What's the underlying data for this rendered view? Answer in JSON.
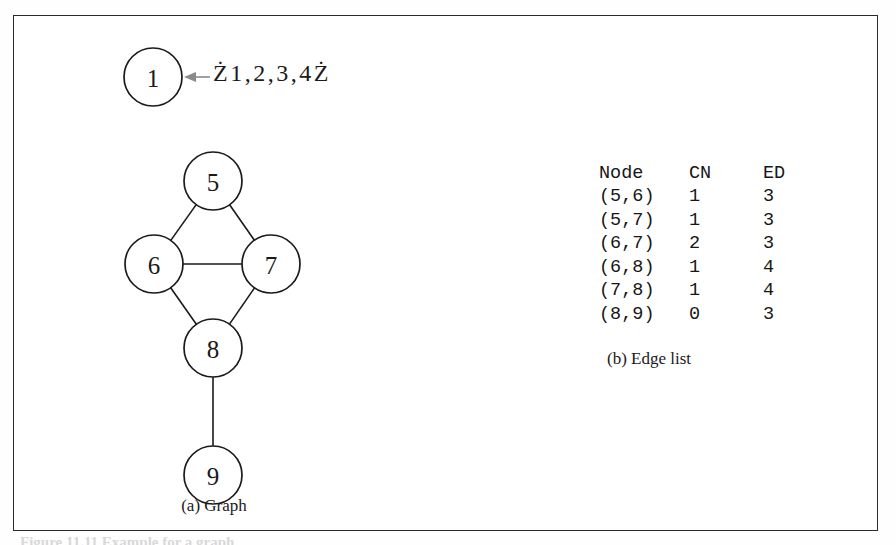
{
  "figure": {
    "graph_panel": {
      "caption": "(a) Graph",
      "set_label": "Ż1,2,3,4Ż",
      "nodes": [
        {
          "id": "1",
          "label": "1",
          "cx": 139,
          "cy": 61,
          "r": 29
        },
        {
          "id": "5",
          "label": "5",
          "cx": 199,
          "cy": 165,
          "r": 29
        },
        {
          "id": "6",
          "label": "6",
          "cx": 140,
          "cy": 248,
          "r": 29
        },
        {
          "id": "7",
          "label": "7",
          "cx": 257,
          "cy": 248,
          "r": 29
        },
        {
          "id": "8",
          "label": "8",
          "cx": 199,
          "cy": 332,
          "r": 29
        },
        {
          "id": "9",
          "label": "9",
          "cx": 199,
          "cy": 459,
          "r": 29
        }
      ],
      "edges": [
        {
          "from": "5",
          "to": "6"
        },
        {
          "from": "5",
          "to": "7"
        },
        {
          "from": "6",
          "to": "7"
        },
        {
          "from": "6",
          "to": "8"
        },
        {
          "from": "7",
          "to": "8"
        },
        {
          "from": "8",
          "to": "9"
        }
      ],
      "annotation_arrow": {
        "name": "node-1-pointer-arrow",
        "from_x": 196,
        "from_y": 61,
        "to_x": 170,
        "to_y": 61,
        "color": "#8a8a8a"
      }
    },
    "edge_list_panel": {
      "caption": "(b) Edge list",
      "headers": [
        "Node",
        "CN",
        "ED"
      ],
      "rows": [
        {
          "node": "(5,6)",
          "cn": "1",
          "ed": "3"
        },
        {
          "node": "(5,7)",
          "cn": "1",
          "ed": "3"
        },
        {
          "node": "(6,7)",
          "cn": "2",
          "ed": "3"
        },
        {
          "node": "(6,8)",
          "cn": "1",
          "ed": "4"
        },
        {
          "node": "(7,8)",
          "cn": "1",
          "ed": "4"
        },
        {
          "node": "(8,9)",
          "cn": "0",
          "ed": "3"
        }
      ]
    },
    "bottom_caption": "Figure 11.11   Example for a graph"
  },
  "colors": {
    "frame": "#2a2a2a",
    "stroke": "#1a1a1a",
    "text": "#171717",
    "arrow": "#8a8a8a"
  }
}
